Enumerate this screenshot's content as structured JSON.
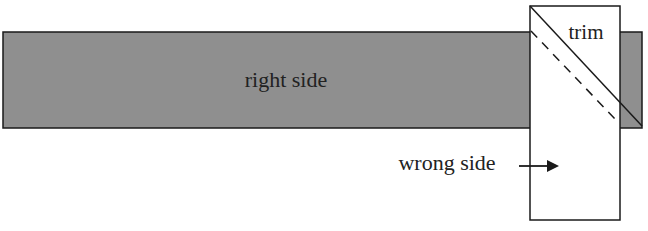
{
  "diagram": {
    "labels": {
      "right_side": "right side",
      "trim": "trim",
      "wrong_side": "wrong side"
    },
    "colors": {
      "strip_fill": "#8f8f8f",
      "outline": "#1a1a1a",
      "background": "#ffffff"
    }
  }
}
